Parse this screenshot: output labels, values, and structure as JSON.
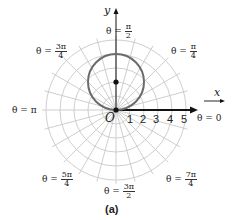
{
  "figure": {
    "caption": "(a)",
    "axes": {
      "x_label": "x",
      "y_label": "y",
      "origin_label": "O"
    },
    "polar_axis_ticks": [
      "1",
      "2",
      "3",
      "4",
      "5"
    ],
    "angle_labels": {
      "zero": {
        "prefix": "θ = ",
        "value": "0"
      },
      "pi_over_4": {
        "prefix": "θ = ",
        "num": "π",
        "den": "4"
      },
      "pi_over_2": {
        "prefix": "θ = ",
        "num": "π",
        "den": "2"
      },
      "three_pi_over_4": {
        "prefix": "θ = ",
        "num": "3π",
        "den": "4"
      },
      "pi": {
        "prefix": "θ = ",
        "value": "π"
      },
      "five_pi_over_4": {
        "prefix": "θ = ",
        "num": "5π",
        "den": "4"
      },
      "three_pi_over_2": {
        "prefix": "θ = ",
        "num": "3π",
        "den": "2"
      },
      "seven_pi_over_4": {
        "prefix": "θ = ",
        "num": "7π",
        "den": "4"
      }
    },
    "grid": {
      "rings": 5,
      "radial_step_degrees": 15
    },
    "curve": {
      "type": "circle",
      "center_r": 2,
      "center_theta": "π/2",
      "radius": 2,
      "color": "#6b6b6b"
    },
    "center_point": {
      "r": 2,
      "theta": "π/2"
    },
    "colors": {
      "grid": "#c8c8c8",
      "axis": "#111111",
      "curve": "#6b6b6b"
    }
  }
}
